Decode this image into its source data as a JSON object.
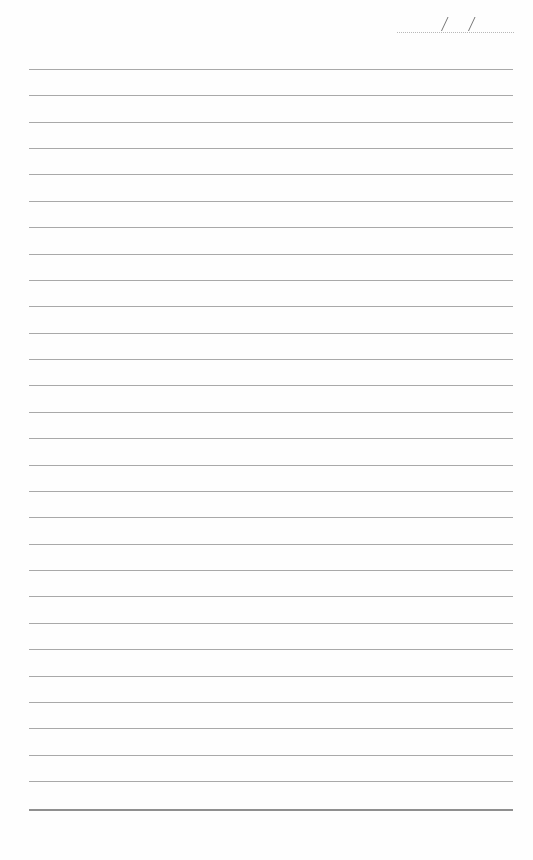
{
  "page": {
    "type": "lined notebook page",
    "background_color": "#fefefe",
    "rule_color": "#a9a9a9"
  },
  "date_field": {
    "separator_1": "/",
    "separator_2": "/",
    "value": ""
  },
  "ruled_lines": {
    "count": 28,
    "first_y": 69,
    "spacing": 26.37,
    "bottom_rule_y": 809
  },
  "content": {
    "text": ""
  }
}
